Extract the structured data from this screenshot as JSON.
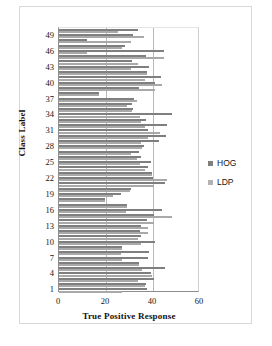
{
  "chart_data": {
    "type": "bar",
    "orientation": "horizontal",
    "title": "",
    "xlabel": "True Positive Response",
    "ylabel": "Class Label",
    "xlim": [
      0,
      60
    ],
    "xticks": [
      0,
      20,
      40,
      60
    ],
    "yticks": [
      1,
      4,
      7,
      10,
      13,
      16,
      19,
      22,
      25,
      28,
      31,
      34,
      37,
      40,
      43,
      46,
      49
    ],
    "grid": "vertical-at-20-and-40",
    "legend_position": "right",
    "categories": [
      1,
      2,
      3,
      4,
      5,
      6,
      7,
      8,
      9,
      10,
      11,
      12,
      13,
      14,
      15,
      16,
      17,
      18,
      19,
      20,
      21,
      22,
      23,
      24,
      25,
      26,
      27,
      28,
      29,
      30,
      31,
      32,
      33,
      34,
      35,
      36,
      37,
      38,
      39,
      40,
      41,
      42,
      43,
      44,
      45,
      46,
      47,
      48,
      49,
      50
    ],
    "series": [
      {
        "name": "HOG",
        "color": "#7f7f7f",
        "values": [
          37.5,
          37.0,
          40.5,
          39.0,
          45.0,
          34.0,
          38.0,
          38.5,
          27.0,
          41.0,
          35.0,
          34.5,
          35.0,
          37.5,
          40.5,
          44.0,
          29.0,
          19.5,
          26.5,
          30.5,
          45.0,
          40.0,
          39.5,
          38.0,
          39.0,
          35.0,
          34.0,
          36.0,
          42.5,
          45.5,
          38.0,
          46.0,
          37.0,
          48.0,
          31.5,
          31.0,
          32.0,
          17.0,
          34.0,
          41.0,
          43.5,
          37.5,
          38.5,
          31.0,
          37.0,
          44.5,
          28.0,
          12.0,
          31.5,
          33.5
        ]
      },
      {
        "name": "LDP",
        "color": "#a9a9a9",
        "values": [
          27.0,
          36.5,
          33.5,
          39.5,
          35.5,
          34.0,
          27.0,
          26.5,
          27.0,
          35.0,
          33.5,
          38.0,
          38.0,
          40.5,
          48.0,
          28.5,
          29.0,
          19.5,
          23.0,
          30.0,
          40.5,
          46.0,
          39.5,
          36.5,
          34.5,
          33.0,
          30.5,
          35.5,
          35.0,
          38.0,
          43.0,
          36.5,
          35.0,
          34.5,
          31.0,
          29.0,
          33.0,
          17.0,
          41.0,
          44.0,
          36.5,
          37.5,
          30.5,
          33.5,
          44.5,
          12.0,
          27.0,
          30.5,
          36.0,
          25.0
        ]
      }
    ]
  },
  "legend": {
    "items": [
      {
        "label": "HOG"
      },
      {
        "label": "LDP"
      }
    ]
  }
}
